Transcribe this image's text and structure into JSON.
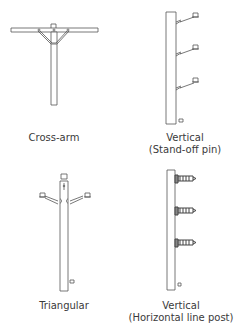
{
  "diagram": {
    "panels": [
      {
        "id": "cross-arm",
        "label_line1": "Cross-arm",
        "label_line2": ""
      },
      {
        "id": "vertical-standoff",
        "label_line1": "Vertical",
        "label_line2": "(Stand-off pin)"
      },
      {
        "id": "triangular",
        "label_line1": "Triangular",
        "label_line2": ""
      },
      {
        "id": "vertical-horizontal-post",
        "label_line1": "Vertical",
        "label_line2": "(Horizontal line post)"
      }
    ],
    "colors": {
      "line": "#555555",
      "background": "#ffffff"
    }
  }
}
